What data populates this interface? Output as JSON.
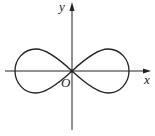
{
  "diagram": {
    "title": "",
    "type": "lemniscate",
    "labels": {
      "x_axis": "x",
      "y_axis": "y",
      "origin": "O"
    },
    "colors": {
      "stroke": "#222222",
      "background": "#ffffff"
    }
  }
}
